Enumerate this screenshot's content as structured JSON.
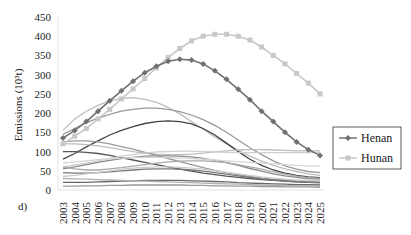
{
  "chart_data": {
    "type": "line",
    "title": "",
    "panel_label": "d)",
    "xlabel": "",
    "ylabel": "Emissions (10³t)",
    "ylim": [
      0,
      450
    ],
    "yticks": [
      0,
      50,
      100,
      150,
      200,
      250,
      300,
      350,
      400,
      450
    ],
    "x": [
      2003,
      2004,
      2005,
      2006,
      2007,
      2008,
      2009,
      2010,
      2011,
      2012,
      2013,
      2014,
      2015,
      2016,
      2017,
      2018,
      2019,
      2020,
      2021,
      2022,
      2023,
      2024,
      2025
    ],
    "grid": false,
    "legend_position": "right",
    "series": [
      {
        "name": "Henan",
        "color": "#707070",
        "marker": "diamond",
        "values": [
          135,
          155,
          178,
          205,
          232,
          258,
          283,
          305,
          322,
          335,
          340,
          338,
          328,
          310,
          288,
          262,
          235,
          205,
          178,
          150,
          125,
          105,
          90
        ]
      },
      {
        "name": "Hunan",
        "color": "#c8c8c8",
        "marker": "square",
        "values": [
          120,
          140,
          160,
          185,
          210,
          237,
          263,
          290,
          318,
          345,
          368,
          388,
          400,
          405,
          405,
          400,
          390,
          372,
          350,
          328,
          303,
          278,
          250
        ]
      }
    ],
    "background_series_note": "Many unlabeled gray curves for other provinces ranging 0-240",
    "background_series": [
      {
        "color": "#bdbdbd",
        "values": [
          155,
          185,
          205,
          220,
          232,
          238,
          240,
          236,
          228,
          215,
          198,
          178,
          158,
          138,
          120,
          103,
          88,
          75,
          64,
          55,
          48,
          42,
          38
        ]
      },
      {
        "color": "#9a9a9a",
        "values": [
          145,
          160,
          175,
          187,
          197,
          205,
          210,
          213,
          213,
          210,
          204,
          195,
          183,
          168,
          150,
          130,
          110,
          92,
          76,
          63,
          54,
          48,
          45
        ]
      },
      {
        "color": "#444444",
        "values": [
          80,
          95,
          112,
          128,
          143,
          155,
          165,
          173,
          178,
          180,
          178,
          172,
          160,
          143,
          122,
          100,
          80,
          64,
          52,
          44,
          38,
          34,
          32
        ]
      },
      {
        "color": "#bdbdbd",
        "values": [
          120,
          120,
          118,
          115,
          110,
          105,
          100,
          96,
          93,
          92,
          92,
          93,
          96,
          99,
          102,
          104,
          105,
          105,
          104,
          103,
          102,
          102,
          102
        ]
      },
      {
        "color": "#9a9a9a",
        "values": [
          125,
          128,
          128,
          125,
          120,
          113,
          106,
          98,
          90,
          82,
          74,
          66,
          58,
          51,
          45,
          40,
          35,
          31,
          28,
          26,
          24,
          23,
          22
        ]
      },
      {
        "color": "#555555",
        "values": [
          100,
          100,
          98,
          95,
          90,
          84,
          78,
          72,
          66,
          60,
          54,
          49,
          44,
          40,
          36,
          33,
          30,
          27,
          25,
          23,
          21,
          20,
          19
        ]
      },
      {
        "color": "#cfcfcf",
        "values": [
          60,
          65,
          70,
          76,
          82,
          88,
          92,
          96,
          99,
          100,
          101,
          101,
          100,
          99,
          98,
          97,
          97,
          97,
          97,
          97,
          97,
          97,
          97
        ]
      },
      {
        "color": "#8a8a8a",
        "values": [
          55,
          60,
          66,
          72,
          77,
          82,
          85,
          88,
          89,
          89,
          88,
          86,
          82,
          77,
          71,
          64,
          56,
          49,
          42,
          37,
          33,
          30,
          28
        ]
      },
      {
        "color": "#aaaaaa",
        "values": [
          60,
          55,
          52,
          52,
          55,
          58,
          62,
          66,
          70,
          73,
          75,
          76,
          76,
          74,
          71,
          66,
          60,
          54,
          47,
          41,
          36,
          32,
          30
        ]
      },
      {
        "color": "#777777",
        "values": [
          45,
          44,
          44,
          45,
          47,
          50,
          52,
          54,
          55,
          55,
          54,
          52,
          49,
          45,
          41,
          37,
          33,
          29,
          26,
          23,
          21,
          20,
          19
        ]
      },
      {
        "color": "#cccccc",
        "values": [
          35,
          38,
          42,
          46,
          50,
          54,
          57,
          59,
          60,
          60,
          59,
          57,
          54,
          50,
          46,
          42,
          38,
          34,
          31,
          28,
          26,
          25,
          24
        ]
      },
      {
        "color": "#666666",
        "values": [
          20,
          20,
          20,
          21,
          22,
          23,
          24,
          25,
          25,
          25,
          25,
          24,
          23,
          22,
          21,
          19,
          18,
          17,
          16,
          15,
          14,
          14,
          13
        ]
      },
      {
        "color": "#b0b0b0",
        "values": [
          30,
          29,
          28,
          27,
          26,
          25,
          24,
          23,
          22,
          21,
          20,
          19,
          18,
          17,
          16,
          15,
          14,
          13,
          12,
          12,
          11,
          11,
          10
        ]
      },
      {
        "color": "#999999",
        "values": [
          10,
          10,
          11,
          11,
          12,
          12,
          13,
          13,
          13,
          13,
          13,
          12,
          12,
          11,
          11,
          10,
          10,
          9,
          9,
          8,
          8,
          8,
          7
        ]
      },
      {
        "color": "#d5d5d5",
        "values": [
          70,
          73,
          76,
          79,
          81,
          83,
          84,
          85,
          85,
          84,
          83,
          82,
          80,
          78,
          76,
          74,
          72,
          70,
          68,
          66,
          64,
          63,
          62
        ]
      }
    ]
  }
}
